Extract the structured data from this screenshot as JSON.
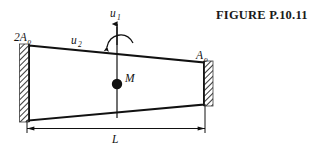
{
  "figure": {
    "title": "FIGURE P.10.11",
    "labels": {
      "left_area": "2A",
      "left_area_sub": "o",
      "right_area": "A",
      "right_area_sub": "o",
      "dof_vertical": "u",
      "dof_vertical_sub": "1",
      "dof_rotation": "u",
      "dof_rotation_sub": "2",
      "mass": "M",
      "length": "L"
    },
    "colors": {
      "ink": "#111111",
      "title": "#1a1a1a",
      "hatch": "#4d4d4d",
      "background": "#ffffff"
    }
  }
}
